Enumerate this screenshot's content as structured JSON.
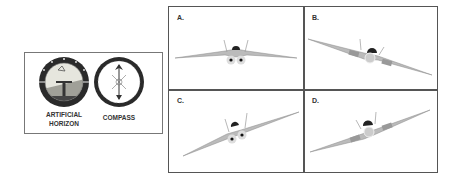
{
  "instruments": {
    "artificial_horizon": {
      "label_line1": "ARTIFICIAL",
      "label_line2": "HORIZON"
    },
    "compass": {
      "label": "COMPASS"
    }
  },
  "panels": [
    {
      "id": "A",
      "label": "A.",
      "bank": "level"
    },
    {
      "id": "B",
      "label": "B.",
      "bank": "right-wing-down"
    },
    {
      "id": "C",
      "label": "C.",
      "bank": "left-wing-down"
    },
    {
      "id": "D",
      "label": "D.",
      "bank": "left-wing-down-rear"
    }
  ],
  "colors": {
    "border": "#555555",
    "sky": "#e4e4dc",
    "ground": "#9a9a92",
    "dial_ring": "#2a2a2a",
    "wing": "#b8b8b8"
  }
}
